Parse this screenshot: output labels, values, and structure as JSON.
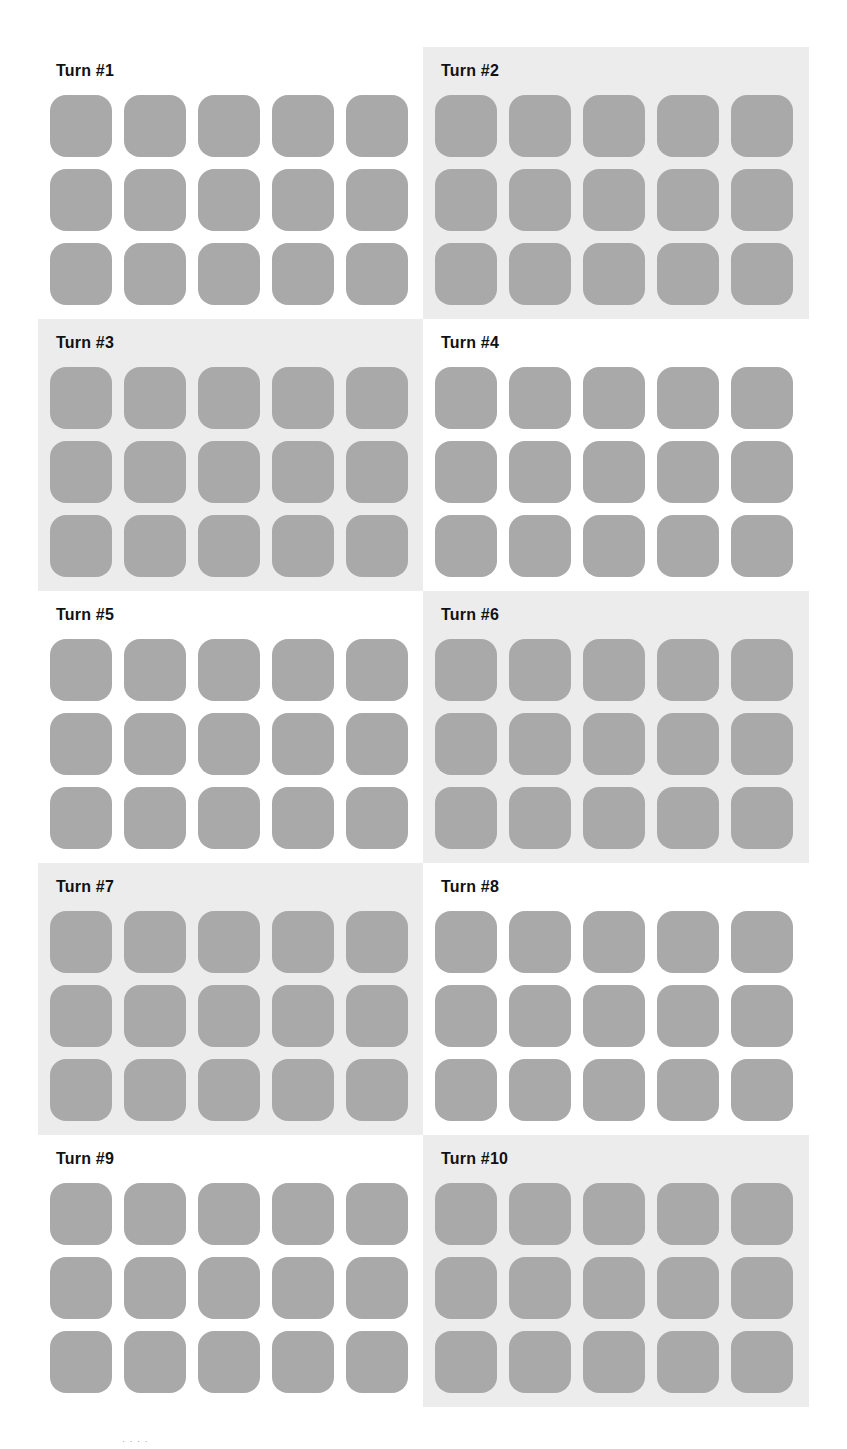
{
  "page": {
    "layout": "2x5 grid of turn panels, checkerboard backgrounds",
    "colors": {
      "background": "#ffffff",
      "panel_shaded": "#ececec",
      "tile": "#a9a9a9",
      "title_text": "#111111"
    }
  },
  "panels": [
    {
      "title": "Turn #1",
      "shaded": false,
      "rows": 3,
      "cols": 5
    },
    {
      "title": "Turn #2",
      "shaded": true,
      "rows": 3,
      "cols": 5
    },
    {
      "title": "Turn #3",
      "shaded": true,
      "rows": 3,
      "cols": 5
    },
    {
      "title": "Turn #4",
      "shaded": false,
      "rows": 3,
      "cols": 5
    },
    {
      "title": "Turn #5",
      "shaded": false,
      "rows": 3,
      "cols": 5
    },
    {
      "title": "Turn #6",
      "shaded": true,
      "rows": 3,
      "cols": 5
    },
    {
      "title": "Turn #7",
      "shaded": true,
      "rows": 3,
      "cols": 5
    },
    {
      "title": "Turn #8",
      "shaded": false,
      "rows": 3,
      "cols": 5
    },
    {
      "title": "Turn #9",
      "shaded": false,
      "rows": 3,
      "cols": 5
    },
    {
      "title": "Turn #10",
      "shaded": true,
      "rows": 3,
      "cols": 5
    }
  ],
  "footer": {
    "mark": "· · · ·"
  }
}
